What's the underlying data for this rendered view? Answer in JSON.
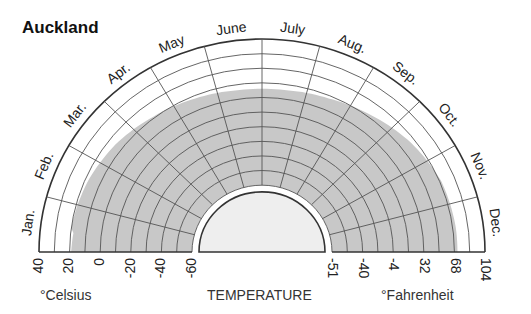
{
  "title": "Auckland",
  "chart_data": {
    "type": "polar-area",
    "title": "Auckland",
    "xlabel": "TEMPERATURE",
    "months": [
      "Jan.",
      "Feb.",
      "Mar.",
      "Apr.",
      "May",
      "June",
      "July",
      "Aug.",
      "Sep.",
      "Oct.",
      "Nov.",
      "Dec."
    ],
    "celsius_ticks": [
      "40",
      "20",
      "0",
      "-20",
      "-40",
      "-60"
    ],
    "fahrenheit_ticks": [
      "-51",
      "-40",
      "-4",
      "32",
      "68",
      "104"
    ],
    "left_axis_label": "°Celsius",
    "right_axis_label": "°Fahrenheit",
    "shaded_extent_ring": [
      2.0,
      2.2,
      2.5,
      2.9,
      3.2,
      3.4,
      3.4,
      3.2,
      2.8,
      2.3,
      1.9,
      1.8
    ],
    "rings": 10,
    "colors": {
      "shade": "#c8c8c8",
      "grid": "#555555",
      "inner": "#eeeeee",
      "outline": "#333333"
    }
  },
  "labels": {
    "celsius": "°Celsius",
    "temperature": "TEMPERATURE",
    "fahrenheit": "°Fahrenheit"
  }
}
